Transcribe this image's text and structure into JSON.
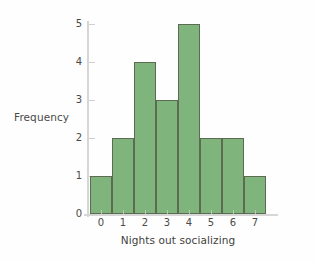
{
  "chart_data": {
    "type": "bar",
    "title": "",
    "subtitle": "",
    "xlabel": "Nights out socializing",
    "ylabel": "Frequency",
    "categories": [
      "0",
      "1",
      "2",
      "3",
      "4",
      "5",
      "6",
      "7"
    ],
    "values": [
      1,
      2,
      4,
      3,
      5,
      2,
      2,
      1
    ],
    "series": [
      {
        "name": "Frequency",
        "values": [
          1,
          2,
          4,
          3,
          5,
          2,
          2,
          1
        ]
      }
    ],
    "xlim": [
      -0.5,
      7.5
    ],
    "ylim": [
      0,
      5
    ],
    "ytick_labels": [
      "0",
      "1",
      "2",
      "3",
      "4",
      "5"
    ],
    "ytick_values": [
      0,
      1,
      2,
      3,
      4,
      5
    ],
    "xtick_labels": [
      "0",
      "1",
      "2",
      "3",
      "4",
      "5",
      "6",
      "7"
    ],
    "grid": false,
    "legend": false,
    "legend_position": "none",
    "annotations": [],
    "colors": {
      "bar_fill": "#7fb57c",
      "bar_border": "#5d6b52",
      "axis_line": "#d6d6d6",
      "tick_label": "#4a4a48",
      "axis_label": "#3f3f3d",
      "background": "#fefefe"
    }
  }
}
